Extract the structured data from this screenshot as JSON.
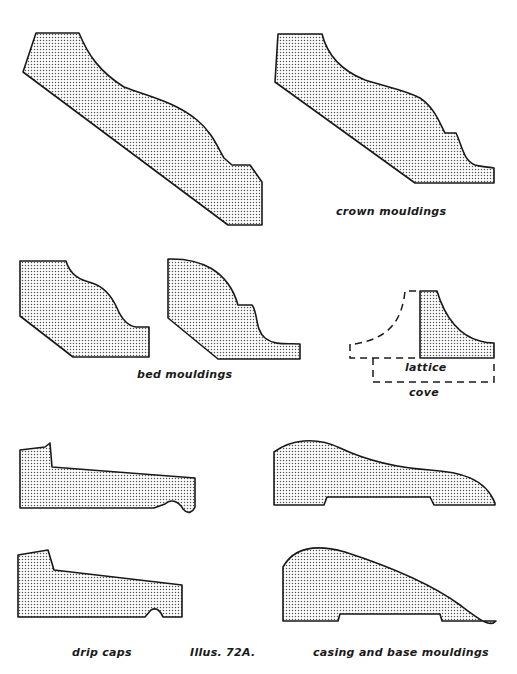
{
  "figure": {
    "caption": "Illus. 72A.",
    "groups": [
      {
        "id": "crown",
        "label": "crown mouldings",
        "count": 2
      },
      {
        "id": "bed",
        "label": "bed mouldings",
        "count": 2
      },
      {
        "id": "lattice",
        "label": "lattice",
        "count": 1
      },
      {
        "id": "cove",
        "label": "cove",
        "count": 1
      },
      {
        "id": "drip",
        "label": "drip caps",
        "count": 2
      },
      {
        "id": "casing",
        "label": "casing and base mouldings",
        "count": 2
      }
    ]
  },
  "labels": {
    "crown": "crown mouldings",
    "bed": "bed mouldings",
    "lattice": "lattice",
    "cove": "cove",
    "drip": "drip caps",
    "caption": "Illus. 72A.",
    "casing": "casing and base mouldings"
  },
  "colors": {
    "ink": "#1a1a1a",
    "paper": "#ffffff",
    "dot_fill": "#555555"
  }
}
